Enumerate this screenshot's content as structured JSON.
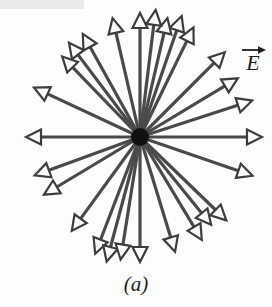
{
  "figure": {
    "caption": "(a)",
    "field_label": "E",
    "field_label_kind": "vector-arrow-over-E",
    "colors": {
      "line": "#4a4a4a",
      "arrowhead_outline": "#3d3d3d",
      "arrowhead_fill": "#ffffff",
      "charge_dot": "#111111",
      "background": "#fdfdfd",
      "bleed_bar": "#e9e9ea",
      "text": "#1c1c1c"
    },
    "center": {
      "x": 140,
      "y": 137
    },
    "charge_dot_radius": 9,
    "line_width": 3.2,
    "arrowhead": {
      "length": 15,
      "half_width": 7.5,
      "stroke": 2.2
    }
  },
  "chart_data": {
    "type": "scatter",
    "title": "",
    "subtitle": "",
    "xlabel": "",
    "ylabel": "",
    "annotations": [
      "E",
      "(a)"
    ],
    "legend": [],
    "grid": false,
    "center": {
      "x": 140,
      "y": 137
    },
    "rays": [
      {
        "angle_deg": 0,
        "length": 122
      },
      {
        "angle_deg": 18,
        "length": 118
      },
      {
        "angle_deg": 31,
        "length": 114
      },
      {
        "angle_deg": 45,
        "length": 120
      },
      {
        "angle_deg": 64,
        "length": 122
      },
      {
        "angle_deg": 71,
        "length": 128
      },
      {
        "angle_deg": 77,
        "length": 122
      },
      {
        "angle_deg": 83,
        "length": 128
      },
      {
        "angle_deg": 90,
        "length": 124
      },
      {
        "angle_deg": 103,
        "length": 122
      },
      {
        "angle_deg": 119,
        "length": 118
      },
      {
        "angle_deg": 127,
        "length": 118
      },
      {
        "angle_deg": 134,
        "length": 112
      },
      {
        "angle_deg": 155,
        "length": 117
      },
      {
        "angle_deg": 180,
        "length": 114
      },
      {
        "angle_deg": 200,
        "length": 112
      },
      {
        "angle_deg": 211,
        "length": 112
      },
      {
        "angle_deg": 234,
        "length": 116
      },
      {
        "angle_deg": 249,
        "length": 125
      },
      {
        "angle_deg": 255,
        "length": 129
      },
      {
        "angle_deg": 261,
        "length": 124
      },
      {
        "angle_deg": 270,
        "length": 125
      },
      {
        "angle_deg": 287,
        "length": 120
      },
      {
        "angle_deg": 301,
        "length": 120
      },
      {
        "angle_deg": 309,
        "length": 113
      },
      {
        "angle_deg": 316,
        "length": 120
      },
      {
        "angle_deg": 341,
        "length": 119
      }
    ]
  },
  "bleed_through": {
    "line1": "",
    "line2": "",
    "line3": "",
    "line4": "",
    "line5": ""
  }
}
